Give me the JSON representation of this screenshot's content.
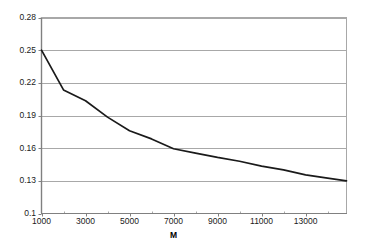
{
  "chart_data": {
    "type": "line",
    "title": "",
    "subtitle": "",
    "xlabel": "M",
    "ylabel": "",
    "xlim": [
      1000,
      14860
    ],
    "ylim": [
      0.1,
      0.28
    ],
    "grid": "horizontal",
    "legend": "none",
    "x_ticks": [
      1000,
      3000,
      5000,
      7000,
      9000,
      11000,
      13000
    ],
    "x_tick_labels": [
      "1000",
      "3000",
      "5000",
      "7000",
      "9000",
      "11000",
      "13000"
    ],
    "x_minor_ticks": [
      2000,
      4000,
      6000,
      8000,
      10000,
      12000,
      14000
    ],
    "y_ticks": [
      0.1,
      0.13,
      0.16,
      0.19,
      0.22,
      0.25,
      0.28
    ],
    "y_tick_labels": [
      "0.1",
      "0.13",
      "0.16",
      "0.19",
      "0.22",
      "0.25",
      "0.28"
    ],
    "series": [
      {
        "name": "",
        "color": "#1a1a1a",
        "x": [
          1000,
          2000,
          3000,
          4000,
          5000,
          6000,
          7000,
          8000,
          9000,
          10000,
          11000,
          12000,
          13000,
          14000,
          14860
        ],
        "values": [
          0.25,
          0.2135,
          0.2035,
          0.1885,
          0.176,
          0.1685,
          0.1595,
          0.1555,
          0.1515,
          0.148,
          0.1435,
          0.14,
          0.1355,
          0.1325,
          0.13
        ]
      }
    ]
  },
  "axis": {
    "x_title": "M"
  }
}
